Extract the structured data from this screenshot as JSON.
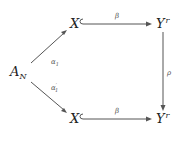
{
  "diagram": {
    "type": "commutative-diagram",
    "nodes": {
      "a_n": {
        "base": "A",
        "sub": "N"
      },
      "x_top": {
        "base": "X"
      },
      "y_top": {
        "base": "Y",
        "sup": "r"
      },
      "x_bottom": {
        "base": "X"
      },
      "y_bottom": {
        "base": "Y",
        "sup": "r"
      }
    },
    "edges": {
      "alpha1": {
        "from": "A_N",
        "to": "X (top)",
        "label_base": "α",
        "label_sub": "1",
        "label_prime": ""
      },
      "alpha1_prime": {
        "from": "A_N",
        "to": "X (bottom)",
        "label_base": "α",
        "label_sub": "1",
        "label_prime": "′"
      },
      "beta_top": {
        "from": "X (top)",
        "to": "Y^r (top)",
        "label": "β",
        "style": "hook-inclusion"
      },
      "beta_bottom": {
        "from": "X (bottom)",
        "to": "Y^r (bottom)",
        "label": "β",
        "style": "hook-inclusion"
      },
      "rho": {
        "from": "Y^r (top)",
        "to": "Y^r (bottom)",
        "label": "ρ"
      }
    }
  }
}
